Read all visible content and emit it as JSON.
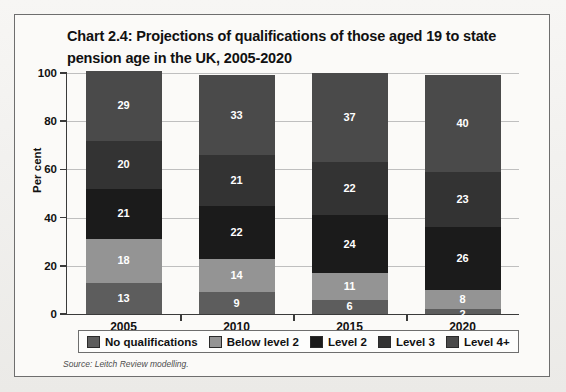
{
  "chart_data": {
    "type": "bar",
    "stacked": true,
    "title": "Chart 2.4: Projections of qualifications of those aged 19 to state pension age in the UK, 2005-2020",
    "xlabel": "",
    "ylabel": "Per cent",
    "ylim": [
      0,
      100
    ],
    "yticks": [
      0,
      20,
      40,
      60,
      80,
      100
    ],
    "ytick_labels": [
      "0",
      "20",
      "40",
      "60",
      "80",
      "100"
    ],
    "grid": true,
    "legend_position": "bottom",
    "categories": [
      "2005",
      "2010",
      "2015",
      "2020"
    ],
    "series": [
      {
        "name": "No qualifications",
        "color": "#5d5d5d",
        "values": [
          13,
          9,
          6,
          2
        ]
      },
      {
        "name": "Below level 2",
        "color": "#949494",
        "values": [
          18,
          14,
          11,
          8
        ]
      },
      {
        "name": "Level 2",
        "color": "#1b1b1b",
        "values": [
          21,
          22,
          24,
          26
        ]
      },
      {
        "name": "Level 3",
        "color": "#333333",
        "values": [
          20,
          21,
          22,
          23
        ]
      },
      {
        "name": "Level 4+",
        "color": "#4a4a4a",
        "values": [
          29,
          33,
          37,
          40
        ]
      }
    ],
    "source": "Source: Leitch Review modelling."
  },
  "legend": {
    "items": [
      {
        "label": "No qualifications",
        "color": "#5d5d5d"
      },
      {
        "label": "Below level 2",
        "color": "#949494"
      },
      {
        "label": "Level 2",
        "color": "#1b1b1b"
      },
      {
        "label": "Level 3",
        "color": "#333333"
      },
      {
        "label": "Level 4+",
        "color": "#4a4a4a"
      }
    ]
  }
}
